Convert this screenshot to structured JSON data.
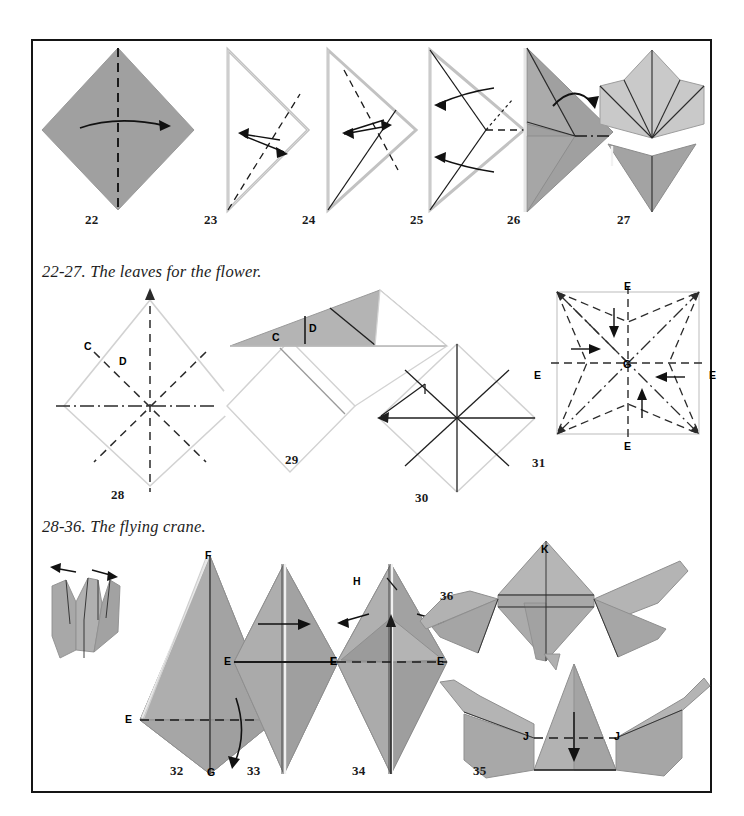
{
  "page": {
    "width": 744,
    "height": 816,
    "background": "#ffffff",
    "border_color": "#151515"
  },
  "colors": {
    "paper_front": "#a0a0a0",
    "paper_front_alt": "#9a9a9a",
    "paper_back": "#c9c9c9",
    "paper_light": "#b4b4b4",
    "paper_white": "#fbfbfb",
    "edge_light": "#c0c0c0",
    "crease": "#1a1a1a",
    "arrow": "#111111",
    "label": "#000000"
  },
  "captions": [
    {
      "id": "caption-leaves",
      "text": "22-27. The leaves for the flower."
    },
    {
      "id": "caption-crane",
      "text": "28-36. The flying crane."
    }
  ],
  "rows": [
    {
      "id": "row-leaves",
      "steps": [
        {
          "number": "22",
          "name": "square-base-diamond",
          "desc": "Gray diamond with vertical valley fold and horizontal curved arrow"
        },
        {
          "number": "23",
          "name": "folded-triangle-left",
          "desc": "Folded triangle outline with dashed fold and double arrow"
        },
        {
          "number": "24",
          "name": "folded-triangle-crease",
          "desc": "Triangle with dashed and solid creases, double arrow"
        },
        {
          "number": "25",
          "name": "petal-fold-prep",
          "desc": "Triangle with dashed lines and two curved arrows pointing left"
        },
        {
          "number": "26",
          "name": "leaf-shaded",
          "desc": "Shaded leaf form with dash-dot line and curved arrow"
        },
        {
          "number": "27",
          "name": "finished-leaves",
          "desc": "Two finished leaf pieces, light top and gray bottom"
        }
      ]
    },
    {
      "id": "row-crane-base",
      "steps": [
        {
          "number": "28",
          "name": "crease-pattern-diamond",
          "desc": "White diamond with dashed diagonals and dash-dot horizontal"
        },
        {
          "number": "29",
          "name": "preliminary-fold",
          "desc": "Shaded triangle flap over square"
        },
        {
          "number": "30",
          "name": "crease-pattern-star",
          "desc": "Diamond with eight solid creases and arrows"
        },
        {
          "number": "31",
          "name": "square-star-creases",
          "desc": "Square with eight dashed creases, four E arrows toward center G"
        }
      ]
    },
    {
      "id": "row-crane-finish",
      "steps": [
        {
          "number": "32",
          "name": "bird-base-kite",
          "desc": "Kite shape F top, G bottom, E sides, valley fold dashed E-E"
        },
        {
          "number": "33",
          "name": "bird-base-narrow",
          "desc": "Narrow diamond, solid E-E line, right arrow"
        },
        {
          "number": "34",
          "name": "bird-base-petal",
          "desc": "Narrow diamond with H label and two outward arrows"
        },
        {
          "number": "35",
          "name": "crane-head-fold",
          "desc": "Crane form with J-J dashed fold and down arrow"
        },
        {
          "number": "36",
          "name": "finished-crane",
          "desc": "Completed flying crane with K label"
        }
      ]
    }
  ],
  "point_labels": [
    {
      "id": "lbl-28-C",
      "text": "C",
      "step": "28"
    },
    {
      "id": "lbl-28-D",
      "text": "D",
      "step": "28"
    },
    {
      "id": "lbl-29-C",
      "text": "C",
      "step": "29"
    },
    {
      "id": "lbl-29-D",
      "text": "D",
      "step": "29"
    },
    {
      "id": "lbl-31-E-top",
      "text": "E",
      "step": "31"
    },
    {
      "id": "lbl-31-E-left",
      "text": "E",
      "step": "31"
    },
    {
      "id": "lbl-31-E-right",
      "text": "E",
      "step": "31"
    },
    {
      "id": "lbl-31-E-bottom",
      "text": "E",
      "step": "31"
    },
    {
      "id": "lbl-31-G",
      "text": "G",
      "step": "31"
    },
    {
      "id": "lbl-32-F",
      "text": "F",
      "step": "32"
    },
    {
      "id": "lbl-32-G",
      "text": "G",
      "step": "32"
    },
    {
      "id": "lbl-32-E-left",
      "text": "E",
      "step": "32"
    },
    {
      "id": "lbl-32-E-right",
      "text": "E",
      "step": "32"
    },
    {
      "id": "lbl-33-E-left",
      "text": "E",
      "step": "33"
    },
    {
      "id": "lbl-33-E-right",
      "text": "E",
      "step": "33"
    },
    {
      "id": "lbl-34-E-left",
      "text": "E",
      "step": "34"
    },
    {
      "id": "lbl-34-E-right",
      "text": "E",
      "step": "34"
    },
    {
      "id": "lbl-34-H",
      "text": "H",
      "step": "34"
    },
    {
      "id": "lbl-35-J-left",
      "text": "J",
      "step": "35"
    },
    {
      "id": "lbl-35-J-right",
      "text": "J",
      "step": "35"
    },
    {
      "id": "lbl-36-K",
      "text": "K",
      "step": "36"
    }
  ]
}
